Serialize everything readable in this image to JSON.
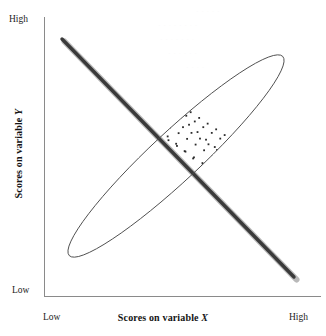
{
  "figure": {
    "type": "scatterplot-with-ellipse"
  },
  "axes": {
    "x": {
      "title_text": "Scores on variable",
      "title_variable": "X",
      "low_label": "Low",
      "high_label": "High"
    },
    "y": {
      "title_text": "Scores on variable",
      "title_variable": "Y",
      "low_label": "Low",
      "high_label": "High"
    }
  },
  "colors": {
    "axis": "#8a8a8a",
    "ellipse": "#4a4a4a",
    "regression_line": "#3a3a3a",
    "regression_shadow": "#b9b9b9",
    "point": "#2b2b2b",
    "text": "#141414",
    "background": "#ffffff"
  },
  "bleed_through_text": [
    "· · · · ·",
    "· · · · · · · ·",
    "· · · · · · ·",
    "· · · · · ·",
    "· · · ·"
  ],
  "chart_data": {
    "type": "scatter",
    "title": "",
    "xlabel": "Scores on variable X",
    "ylabel": "Scores on variable Y",
    "xlim": [
      0,
      100
    ],
    "ylim": [
      0,
      100
    ],
    "xtick_labels": [
      "Low",
      "High"
    ],
    "ytick_labels": [
      "Low",
      "High"
    ],
    "grid": false,
    "legend": null,
    "correlation": -0.95,
    "regression_line": {
      "x0": 0,
      "y0": 97,
      "x1": 100,
      "y1": 3
    },
    "ellipse": {
      "center_x": 50,
      "center_y": 50,
      "semi_major": 66,
      "semi_minor": 11,
      "rotation_deg": -43
    },
    "points": [
      [
        1.5,
        96.0
      ],
      [
        3.2,
        93.4
      ],
      [
        4.6,
        98.2
      ],
      [
        2.4,
        90.1
      ],
      [
        6.1,
        95.0
      ],
      [
        5.0,
        88.7
      ],
      [
        7.8,
        92.6
      ],
      [
        3.9,
        86.3
      ],
      [
        9.2,
        94.1
      ],
      [
        6.6,
        89.5
      ],
      [
        8.4,
        85.2
      ],
      [
        10.9,
        91.0
      ],
      [
        5.7,
        83.4
      ],
      [
        12.3,
        93.2
      ],
      [
        9.9,
        87.1
      ],
      [
        11.5,
        82.6
      ],
      [
        14.0,
        89.8
      ],
      [
        8.1,
        80.9
      ],
      [
        15.6,
        91.4
      ],
      [
        12.8,
        85.7
      ],
      [
        14.4,
        81.0
      ],
      [
        17.1,
        87.9
      ],
      [
        10.6,
        78.8
      ],
      [
        18.7,
        89.1
      ],
      [
        15.9,
        83.6
      ],
      [
        17.4,
        79.3
      ],
      [
        20.2,
        85.8
      ],
      [
        13.7,
        76.9
      ],
      [
        21.8,
        87.2
      ],
      [
        19.0,
        81.6
      ],
      [
        20.5,
        77.4
      ],
      [
        23.3,
        83.7
      ],
      [
        16.8,
        74.7
      ],
      [
        24.9,
        85.0
      ],
      [
        22.1,
        79.5
      ],
      [
        23.6,
        75.2
      ],
      [
        26.4,
        81.6
      ],
      [
        19.9,
        72.6
      ],
      [
        28.0,
        82.9
      ],
      [
        25.2,
        77.4
      ],
      [
        26.7,
        73.1
      ],
      [
        29.5,
        79.5
      ],
      [
        23.0,
        70.5
      ],
      [
        31.1,
        80.8
      ],
      [
        28.3,
        75.3
      ],
      [
        29.8,
        71.0
      ],
      [
        32.6,
        77.4
      ],
      [
        26.1,
        68.4
      ],
      [
        34.2,
        78.7
      ],
      [
        31.4,
        73.2
      ],
      [
        32.9,
        68.9
      ],
      [
        35.7,
        75.3
      ],
      [
        29.2,
        66.3
      ],
      [
        37.3,
        76.6
      ],
      [
        34.5,
        71.1
      ],
      [
        36.0,
        66.8
      ],
      [
        38.8,
        73.2
      ],
      [
        32.3,
        64.2
      ],
      [
        40.4,
        74.5
      ],
      [
        37.6,
        69.0
      ],
      [
        39.1,
        64.7
      ],
      [
        41.9,
        71.1
      ],
      [
        35.4,
        62.1
      ],
      [
        43.5,
        72.4
      ],
      [
        40.7,
        66.9
      ],
      [
        42.2,
        62.6
      ],
      [
        45.0,
        69.0
      ],
      [
        38.5,
        60.0
      ],
      [
        46.6,
        70.3
      ],
      [
        43.8,
        64.8
      ],
      [
        45.3,
        60.5
      ],
      [
        48.1,
        66.9
      ],
      [
        41.6,
        57.9
      ],
      [
        49.7,
        68.2
      ],
      [
        46.9,
        62.7
      ],
      [
        48.4,
        58.4
      ],
      [
        51.2,
        64.8
      ],
      [
        44.7,
        55.8
      ],
      [
        52.8,
        66.1
      ],
      [
        50.0,
        60.6
      ],
      [
        51.5,
        56.3
      ],
      [
        54.3,
        62.7
      ],
      [
        47.8,
        53.7
      ],
      [
        55.9,
        64.0
      ],
      [
        53.1,
        58.5
      ],
      [
        54.6,
        54.2
      ],
      [
        57.4,
        60.6
      ],
      [
        50.9,
        51.6
      ],
      [
        59.0,
        61.9
      ],
      [
        56.2,
        56.4
      ],
      [
        57.7,
        52.1
      ],
      [
        60.5,
        58.5
      ],
      [
        54.0,
        49.5
      ],
      [
        62.1,
        59.8
      ],
      [
        59.3,
        54.3
      ],
      [
        60.8,
        50.0
      ],
      [
        63.6,
        56.4
      ],
      [
        57.1,
        47.4
      ],
      [
        65.2,
        57.7
      ],
      [
        62.4,
        52.2
      ],
      [
        63.9,
        47.9
      ],
      [
        66.7,
        54.3
      ],
      [
        60.2,
        45.3
      ],
      [
        68.3,
        55.6
      ],
      [
        65.5,
        50.1
      ],
      [
        67.0,
        45.8
      ],
      [
        69.8,
        52.2
      ],
      [
        63.3,
        43.2
      ],
      [
        71.4,
        53.5
      ],
      [
        68.6,
        48.3
      ],
      [
        70.1,
        44.0
      ],
      [
        72.9,
        50.1
      ],
      [
        66.4,
        41.1
      ],
      [
        74.5,
        51.4
      ],
      [
        71.7,
        46.2
      ],
      [
        73.2,
        41.9
      ],
      [
        76.0,
        48.0
      ],
      [
        69.5,
        39.0
      ],
      [
        77.6,
        49.3
      ],
      [
        74.8,
        44.1
      ],
      [
        76.3,
        39.8
      ],
      [
        79.1,
        45.9
      ],
      [
        72.6,
        36.9
      ],
      [
        80.7,
        47.2
      ],
      [
        77.9,
        42.0
      ],
      [
        79.4,
        37.7
      ],
      [
        82.2,
        43.8
      ],
      [
        75.7,
        34.8
      ],
      [
        83.8,
        45.1
      ],
      [
        81.0,
        39.9
      ],
      [
        82.5,
        35.6
      ],
      [
        85.3,
        41.7
      ],
      [
        78.8,
        32.7
      ],
      [
        86.9,
        43.0
      ],
      [
        84.1,
        37.8
      ],
      [
        85.6,
        33.5
      ],
      [
        88.4,
        39.6
      ],
      [
        81.9,
        30.6
      ],
      [
        90.0,
        40.9
      ],
      [
        87.2,
        35.7
      ],
      [
        88.7,
        31.4
      ],
      [
        91.5,
        37.5
      ],
      [
        85.0,
        28.5
      ],
      [
        93.1,
        38.8
      ],
      [
        90.3,
        33.6
      ],
      [
        91.8,
        29.3
      ],
      [
        94.6,
        35.4
      ],
      [
        88.1,
        26.4
      ],
      [
        96.2,
        36.7
      ],
      [
        93.4,
        31.5
      ],
      [
        94.9,
        27.2
      ],
      [
        97.7,
        33.3
      ],
      [
        91.2,
        24.3
      ],
      [
        98.3,
        29.4
      ],
      [
        96.5,
        25.1
      ],
      [
        94.3,
        22.2
      ],
      [
        97.1,
        20.0
      ],
      [
        99.0,
        22.8
      ],
      [
        95.4,
        18.5
      ],
      [
        98.0,
        16.8
      ],
      [
        92.0,
        21.0
      ],
      [
        89.5,
        27.9
      ],
      [
        86.3,
        30.2
      ],
      [
        83.0,
        33.1
      ],
      [
        80.1,
        36.4
      ],
      [
        77.2,
        38.6
      ],
      [
        74.0,
        42.6
      ],
      [
        70.9,
        45.0
      ],
      [
        67.8,
        47.9
      ],
      [
        64.7,
        50.8
      ],
      [
        61.6,
        53.3
      ],
      [
        58.4,
        56.0
      ],
      [
        55.3,
        58.8
      ],
      [
        52.2,
        61.5
      ],
      [
        49.1,
        64.2
      ],
      [
        46.0,
        66.9
      ],
      [
        42.8,
        69.6
      ],
      [
        39.7,
        72.4
      ],
      [
        36.6,
        75.1
      ],
      [
        33.5,
        77.8
      ],
      [
        30.3,
        80.5
      ],
      [
        27.2,
        83.2
      ],
      [
        24.1,
        85.9
      ],
      [
        21.0,
        88.6
      ],
      [
        17.8,
        91.3
      ],
      [
        14.7,
        94.0
      ],
      [
        11.6,
        92.2
      ],
      [
        8.5,
        90.4
      ],
      [
        5.4,
        93.8
      ],
      [
        2.8,
        97.5
      ],
      [
        13.1,
        84.2
      ],
      [
        16.2,
        81.5
      ],
      [
        19.4,
        78.8
      ],
      [
        22.5,
        76.1
      ],
      [
        25.6,
        73.4
      ],
      [
        28.7,
        70.7
      ],
      [
        31.9,
        68.0
      ],
      [
        35.0,
        65.3
      ],
      [
        38.1,
        62.6
      ],
      [
        41.2,
        59.9
      ],
      [
        44.4,
        57.2
      ],
      [
        47.5,
        54.5
      ],
      [
        50.6,
        51.8
      ],
      [
        53.7,
        49.1
      ],
      [
        56.9,
        46.4
      ],
      [
        60.0,
        43.7
      ],
      [
        63.1,
        41.0
      ],
      [
        66.2,
        38.3
      ],
      [
        69.4,
        35.6
      ],
      [
        72.5,
        32.9
      ],
      [
        75.6,
        30.2
      ],
      [
        78.7,
        27.5
      ],
      [
        81.9,
        24.8
      ],
      [
        85.0,
        22.1
      ],
      [
        88.1,
        19.4
      ],
      [
        7.0,
        97.0
      ],
      [
        10.2,
        96.1
      ],
      [
        4.0,
        91.8
      ],
      [
        93.9,
        17.5
      ],
      [
        96.8,
        13.9
      ],
      [
        90.8,
        15.2
      ],
      [
        87.6,
        23.0
      ],
      [
        84.4,
        26.0
      ],
      [
        79.9,
        31.0
      ],
      [
        2.0,
        88.0
      ]
    ]
  }
}
